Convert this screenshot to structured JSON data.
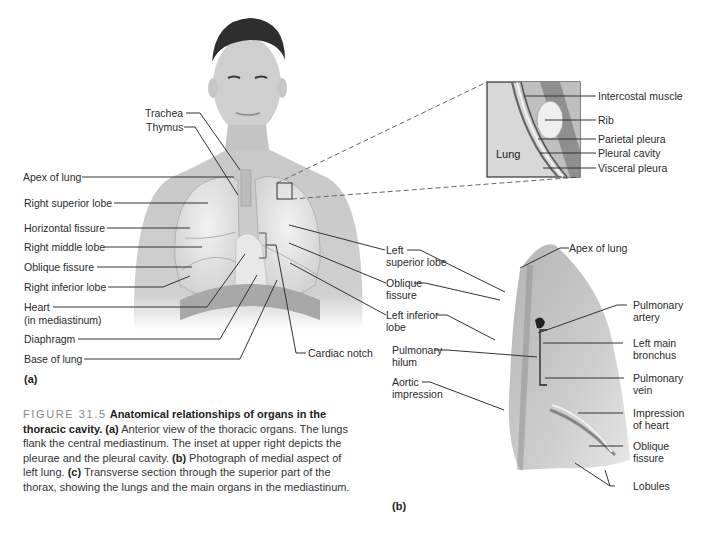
{
  "figure": {
    "number_label": "FIGURE 31.5",
    "title": "Anatomical relationships of organs in the thoracic cavity.",
    "caption_parts": [
      {
        "tag": "(a)",
        "text": " Anterior view of the thoracic organs. The lungs flank the central mediastinum. The inset at upper right depicts the pleurae and the pleural cavity. "
      },
      {
        "tag": "(b)",
        "text": " Photograph of medial aspect of left lung. "
      },
      {
        "tag": "(c)",
        "text": " Transverse section through the superior part of the thorax, showing the lungs and the main organs in the mediastinum."
      }
    ],
    "accent_gray": "#888888"
  },
  "panel_a": {
    "label": "(a)",
    "left_labels": [
      "Trachea",
      "Thymus",
      "Apex of lung",
      "Right superior lobe",
      "Horizontal fissure",
      "Right middle lobe",
      "Oblique fissure",
      "Right inferior lobe",
      "Heart",
      "(in mediastinum)",
      "Diaphragm",
      "Base of lung"
    ],
    "right_labels": [
      "Left",
      "superior lobe",
      "Oblique",
      "fissure",
      "Left inferior",
      "lobe",
      "Cardiac notch"
    ]
  },
  "inset": {
    "inner_label": "Lung",
    "labels": [
      "Intercostal muscle",
      "Rib",
      "Parietal pleura",
      "Pleural cavity",
      "Visceral pleura"
    ]
  },
  "panel_b": {
    "label": "(b)",
    "left_labels": [
      "Pulmonary",
      "hilum",
      "Aortic",
      "impression"
    ],
    "top_label": "Apex of lung",
    "right_labels": [
      "Pulmonary",
      "artery",
      "Left main",
      "bronchus",
      "Pulmonary",
      "vein",
      "Impression",
      "of heart",
      "Oblique",
      "fissure",
      "Lobules"
    ]
  }
}
